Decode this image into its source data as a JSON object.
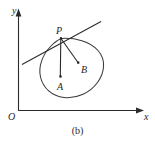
{
  "figure": {
    "caption": "(b)",
    "axes": {
      "y_label": "y",
      "x_label": "x",
      "origin_label": "O"
    },
    "points": [
      {
        "name": "P",
        "label": "P",
        "role": "tangency-point-on-curve"
      },
      {
        "name": "A",
        "label": "A",
        "role": "interior-point"
      },
      {
        "name": "B",
        "label": "B",
        "role": "interior-point"
      }
    ],
    "elements": {
      "closed_curve": "closed-oval-curve",
      "tangent": "tangent-line-at-P",
      "segment_pa": "segment-P-to-A",
      "segment_pb": "segment-P-to-B"
    },
    "colors": {
      "stroke": "#2b2b2b",
      "curve": "#3a3a3a",
      "background": "#ffffff",
      "text": "#1f1f1f"
    }
  }
}
